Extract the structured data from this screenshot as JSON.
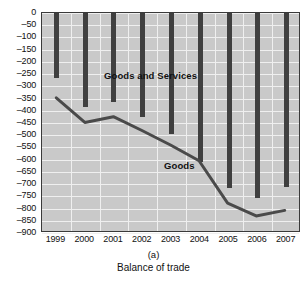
{
  "caption": {
    "panel_letter": "(a)",
    "title": "Balance of trade"
  },
  "chart_data": {
    "type": "bar",
    "title": "Balance of trade",
    "xlabel": "",
    "ylabel": "",
    "categories": [
      "1999",
      "2000",
      "2001",
      "2002",
      "2003",
      "2004",
      "2005",
      "2006",
      "2007"
    ],
    "series": [
      {
        "name": "Goods and Services",
        "type": "bar",
        "values": [
          -265,
          -385,
          -365,
          -425,
          -495,
          -610,
          -715,
          -755,
          -710
        ],
        "color": "#3f3f3f"
      },
      {
        "name": "Goods",
        "type": "line",
        "values": [
          -350,
          -452,
          -428,
          -485,
          -545,
          -610,
          -785,
          -838,
          -815
        ],
        "color": "#4a4a4a"
      }
    ],
    "ylim": [
      -900,
      0
    ],
    "ytick_step": 50,
    "yticks": [
      "0",
      "–50",
      "–100",
      "–150",
      "–200",
      "–250",
      "–300",
      "–350",
      "–400",
      "–450",
      "–500",
      "–550",
      "–600",
      "–650",
      "–700",
      "–750",
      "–800",
      "–850",
      "–900"
    ],
    "ytick_values": [
      0,
      -50,
      -100,
      -150,
      -200,
      -250,
      -300,
      -350,
      -400,
      -450,
      -500,
      -550,
      -600,
      -650,
      -700,
      -750,
      -800,
      -850,
      -900
    ],
    "grid": true,
    "legend_position": "inside-plot-labels",
    "plot_background": "#c9c9c9",
    "grid_color": "#efefef",
    "frame_color": "#3a3a3a"
  }
}
